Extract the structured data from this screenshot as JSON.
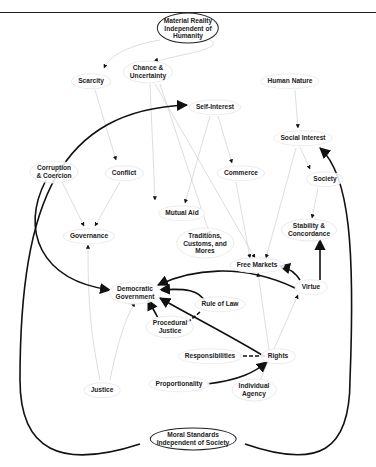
{
  "diagram": {
    "nodes": [
      {
        "id": "material",
        "label": "Material Reality\nIndependent of\nHumanity",
        "x": 188,
        "y": 28,
        "root": true
      },
      {
        "id": "scarcity",
        "label": "Scarcity",
        "x": 91,
        "y": 81
      },
      {
        "id": "chance",
        "label": "Chance &\nUncertainty",
        "x": 148,
        "y": 72
      },
      {
        "id": "humannature",
        "label": "Human Nature",
        "x": 290,
        "y": 81
      },
      {
        "id": "selfinterest",
        "label": "Self-Interest",
        "x": 215,
        "y": 107
      },
      {
        "id": "socialinterest",
        "label": "Social Interest",
        "x": 303,
        "y": 138
      },
      {
        "id": "corruption",
        "label": "Corruption\n& Coercion",
        "x": 54,
        "y": 172
      },
      {
        "id": "conflict",
        "label": "Conflict",
        "x": 124,
        "y": 173
      },
      {
        "id": "commerce",
        "label": "Commerce",
        "x": 241,
        "y": 173
      },
      {
        "id": "society",
        "label": "Society",
        "x": 325,
        "y": 179
      },
      {
        "id": "mutualaid",
        "label": "Mutual Aid",
        "x": 182,
        "y": 213
      },
      {
        "id": "governance",
        "label": "Governance",
        "x": 89,
        "y": 236
      },
      {
        "id": "traditions",
        "label": "Traditions,\nCustoms, and\nMores",
        "x": 205,
        "y": 243
      },
      {
        "id": "stability",
        "label": "Stability &\nConcordance",
        "x": 309,
        "y": 230
      },
      {
        "id": "freemarkets",
        "label": "Free Markets",
        "x": 257,
        "y": 265
      },
      {
        "id": "virtue",
        "label": "Virtue",
        "x": 311,
        "y": 287
      },
      {
        "id": "democratic",
        "label": "Democratic\nGovernment",
        "x": 135,
        "y": 293
      },
      {
        "id": "ruleoflaw",
        "label": "Rule of Law",
        "x": 220,
        "y": 304
      },
      {
        "id": "procedural",
        "label": "Procedural\nJustice",
        "x": 170,
        "y": 327
      },
      {
        "id": "responsibilities",
        "label": "Responsibilities",
        "x": 210,
        "y": 356
      },
      {
        "id": "rights",
        "label": "Rights",
        "x": 278,
        "y": 356
      },
      {
        "id": "proportionality",
        "label": "Proportionality",
        "x": 179,
        "y": 384
      },
      {
        "id": "justice",
        "label": "Justice",
        "x": 102,
        "y": 390
      },
      {
        "id": "agency",
        "label": "Individual\nAgency",
        "x": 254,
        "y": 390
      },
      {
        "id": "moral",
        "label": "Moral Standards\nIndependent of Society",
        "x": 193,
        "y": 439,
        "root": true
      }
    ],
    "thick_edges": [
      {
        "from": "moral",
        "to": "selfinterest",
        "d": "M140,444 C60,470 20,450 20,380 C20,200 60,110 187,105"
      },
      {
        "from": "moral",
        "to": "socialinterest",
        "d": "M245,444 C320,470 350,450 350,380 C355,250 350,175 320,148"
      },
      {
        "from": "corruption",
        "to": "democratic",
        "d": "M46,180 C20,230 40,280 110,290"
      },
      {
        "from": "virtue",
        "to": "democratic",
        "d": "M295,288 C240,262 190,270 158,285"
      },
      {
        "from": "ruleoflaw",
        "to": "democratic",
        "d": "M205,302 C200,290 185,288 160,290"
      },
      {
        "from": "rights",
        "to": "democratic",
        "d": "M262,355 C220,330 180,310 160,298"
      },
      {
        "from": "procedural",
        "to": "democratic",
        "d": "M158,318 C154,310 150,304 148,300"
      },
      {
        "from": "virtue",
        "to": "freemarkets",
        "d": "M300,280 C295,272 288,268 280,266"
      },
      {
        "from": "virtue",
        "to": "stability",
        "d": "M320,280 L320,240"
      },
      {
        "from": "proportionality",
        "to": "rights",
        "d": "M207,384 C240,380 255,372 267,362"
      }
    ],
    "dashed_edges": [
      {
        "from": "rights",
        "to": "responsibilities",
        "d": "M265,356 L240,356"
      },
      {
        "from": "ruleoflaw",
        "to": "procedural",
        "d": "M200,312 L188,322"
      }
    ]
  }
}
